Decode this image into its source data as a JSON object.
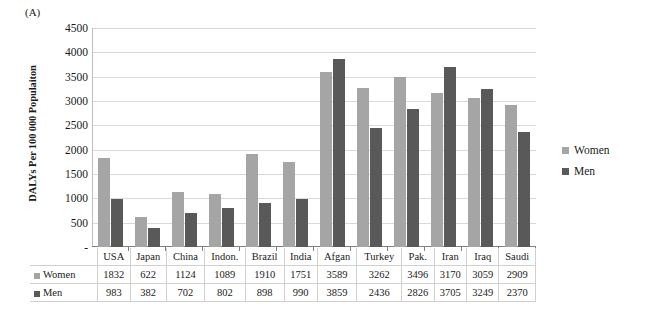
{
  "panel_label": "(A)",
  "legend": {
    "position": "right",
    "items": [
      {
        "label": "Women",
        "color": "#a5a5a5",
        "key": "women"
      },
      {
        "label": "Men",
        "color": "#595959",
        "key": "men"
      }
    ]
  },
  "chart_data": {
    "type": "bar",
    "title": "(A)",
    "xlabel": "",
    "ylabel": "DALYs Per 100 000 Populaiton",
    "ylim": [
      0,
      4500
    ],
    "ytick_labels": [
      "4500",
      "4000",
      "3500",
      "3000",
      "2500",
      "2000",
      "1500",
      "1000",
      "500",
      "-"
    ],
    "ytick_values": [
      4500,
      4000,
      3500,
      3000,
      2500,
      2000,
      1500,
      1000,
      500,
      0
    ],
    "grid": true,
    "legend_position": "right",
    "categories": [
      "USA",
      "Japan",
      "China",
      "Indon.",
      "Brazil",
      "India",
      "Afgan",
      "Turkey",
      "Pak.",
      "Iran",
      "Iraq",
      "Saudi"
    ],
    "series": [
      {
        "name": "Women",
        "color": "#a5a5a5",
        "values": [
          1832,
          622,
          1124,
          1089,
          1910,
          1751,
          3589,
          3262,
          3496,
          3170,
          3059,
          2909
        ]
      },
      {
        "name": "Men",
        "color": "#595959",
        "values": [
          983,
          382,
          702,
          802,
          898,
          990,
          3859,
          2436,
          2826,
          3705,
          3249,
          2370
        ]
      }
    ]
  }
}
